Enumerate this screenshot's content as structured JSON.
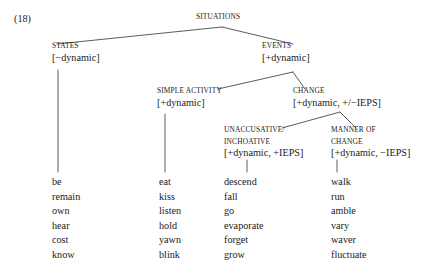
{
  "figure": {
    "example_number": "(18)",
    "root": {
      "label": "SITUATIONS"
    },
    "nodes": [
      {
        "id": "states",
        "label": "STATES",
        "features": "[−dynamic]"
      },
      {
        "id": "events",
        "label": "EVENTS",
        "features": "[+dynamic]"
      },
      {
        "id": "simple-activity",
        "label": "SIMPLE ACTIVITY",
        "features": "[+dynamic]"
      },
      {
        "id": "change",
        "label": "CHANGE",
        "features": "[+dynamic, +/−IEPS]"
      },
      {
        "id": "unaccusative-inchoative",
        "label_line1": "UNACCUSATIVE/",
        "label_line2": "INCHOATIVE",
        "features": "[+dynamic, +IEPS]"
      },
      {
        "id": "manner-of-change",
        "label_line1": "MANNER OF",
        "label_line2": "CHANGE",
        "features": "[+dynamic, −IEPS]"
      }
    ],
    "word_lists": [
      {
        "id": "states-examples",
        "words": [
          "be",
          "remain",
          "own",
          "hear",
          "cost",
          "know"
        ]
      },
      {
        "id": "simple-activity-examples",
        "words": [
          "eat",
          "kiss",
          "listen",
          "hold",
          "yawn",
          "blink"
        ]
      },
      {
        "id": "unaccusative-inchoative-examples",
        "words": [
          "descend",
          "fall",
          "go",
          "evaporate",
          "forget",
          "grow"
        ]
      },
      {
        "id": "manner-of-change-examples",
        "words": [
          "walk",
          "run",
          "amble",
          "vary",
          "waver",
          "fluctuate"
        ]
      }
    ],
    "colors": {
      "background": "#ffffff",
      "text": "#1a1a1a",
      "line": "#4a4a4a"
    }
  }
}
